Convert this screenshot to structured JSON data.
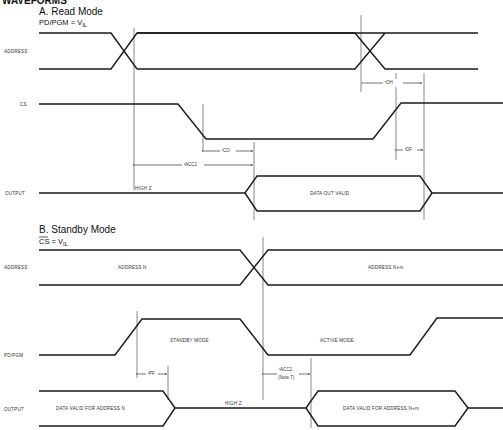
{
  "header": {
    "cut_title": "WAVEFORMS"
  },
  "section_a": {
    "title": "A. Read Mode",
    "condition": "PD/PGM = V",
    "condition_sub": "IL",
    "signals": {
      "address": "ADDRESS",
      "cs": "CS",
      "output": "OUTPUT"
    },
    "states": {
      "high_z": "HIGH Z",
      "data_out_valid": "DATA OUT VALID"
    },
    "params": {
      "toh": "OH",
      "tco": "CO",
      "tacc1": "ACC1",
      "tdf": "DF",
      "t": "t"
    }
  },
  "section_b": {
    "title": "B. Standby Mode",
    "condition": "CS = V",
    "condition_sub": "IL",
    "signals": {
      "address": "ADDRESS",
      "pdpgm": "PD/PGM",
      "output": "OUTPUT"
    },
    "states": {
      "address_n": "ADDRESS N",
      "address_nm": "ADDRESS N+m",
      "standby_mode": "STANDBY MODE",
      "active_mode": "ACTIVE MODE",
      "data_valid_n": "DATA VALID FOR ADDRESS N",
      "high_z": "HIGH Z",
      "data_valid_nm": "DATA VALID FOR ADDRESS N+m"
    },
    "params": {
      "tpf": "PF",
      "tacc2": "ACC2",
      "note": "(Note 7)",
      "t": "t"
    }
  }
}
